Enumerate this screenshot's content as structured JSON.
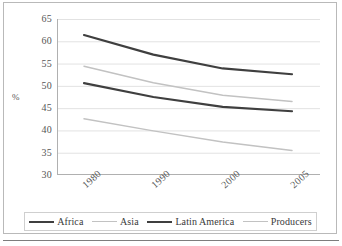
{
  "chart_data": {
    "type": "line",
    "title": "",
    "xlabel": "",
    "ylabel": "%",
    "categories": [
      "1980",
      "1990",
      "2000",
      "2005"
    ],
    "ylim": [
      30,
      65
    ],
    "yticks": [
      65,
      60,
      55,
      50,
      45,
      40,
      35,
      30
    ],
    "grid": true,
    "legend_position": "bottom",
    "series": [
      {
        "name": "Africa",
        "color": "#3f3f3f",
        "width": 2.2,
        "values": [
          61.4,
          57.0,
          53.9,
          52.6
        ]
      },
      {
        "name": "Asia",
        "color": "#c2c2c2",
        "width": 1.5,
        "values": [
          54.4,
          50.7,
          47.9,
          46.5
        ]
      },
      {
        "name": "Latin America",
        "color": "#3f3f3f",
        "width": 2.2,
        "values": [
          50.6,
          47.5,
          45.3,
          44.3
        ]
      },
      {
        "name": "Producers",
        "color": "#c2c2c2",
        "width": 1.5,
        "values": [
          42.6,
          39.9,
          37.4,
          35.5
        ]
      }
    ]
  },
  "axis": {
    "y_title": "%",
    "y_tick_labels": [
      "65",
      "60",
      "55",
      "50",
      "45",
      "40",
      "35",
      "30"
    ],
    "x_tick_labels": [
      "1980",
      "1990",
      "2000",
      "2005"
    ]
  },
  "legend": {
    "items": [
      {
        "label": "Africa"
      },
      {
        "label": "Asia"
      },
      {
        "label": "Latin America"
      },
      {
        "label": "Producers"
      }
    ]
  },
  "style": {
    "grid_color": "#e2e2e2",
    "axis_color": "#b0b0b0",
    "frame_color": "#b9b9b9",
    "text_color": "#555555"
  }
}
